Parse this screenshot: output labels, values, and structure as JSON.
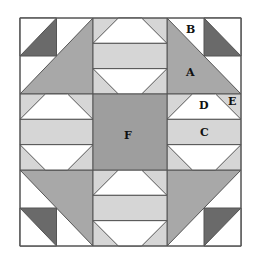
{
  "diagram": {
    "title": "",
    "type": "quilt-block",
    "grid": "3x3",
    "colors": {
      "background": "#ffffff",
      "outline": "#555555",
      "patch_a_medium": "#a8a8a8",
      "patch_dark": "#6a6a6a",
      "patch_light": "#d6d6d6",
      "patch_center": "#9e9e9e",
      "patch_white": "#ffffff"
    },
    "labels": [
      {
        "id": "A",
        "text": "A",
        "patch": "large corner triangle"
      },
      {
        "id": "B",
        "text": "B",
        "patch": "white corner triangle"
      },
      {
        "id": "C",
        "text": "C",
        "patch": "light middle strip"
      },
      {
        "id": "D",
        "text": "D",
        "patch": "white trapezoid"
      },
      {
        "id": "E",
        "text": "E",
        "patch": "light small corner triangle"
      },
      {
        "id": "F",
        "text": "F",
        "patch": "center square"
      }
    ]
  }
}
